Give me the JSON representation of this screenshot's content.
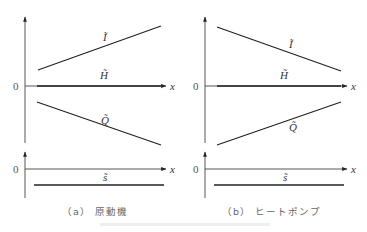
{
  "figure": {
    "panels": [
      {
        "id": "a",
        "caption_label": "（a）",
        "caption_text": "原動機",
        "axis_label_x": "x",
        "zero_label": "0",
        "upper_plot": {
          "lines": [
            {
              "name": "I",
              "label": "Ĩ",
              "trend": "increasing"
            },
            {
              "name": "H",
              "label": "H̃",
              "trend": "constant (on axis)"
            },
            {
              "name": "Q",
              "label": "Q̃",
              "trend": "decreasing"
            }
          ]
        },
        "lower_plot": {
          "lines": [
            {
              "name": "s",
              "label": "s̃",
              "trend": "constant negative"
            }
          ]
        }
      },
      {
        "id": "b",
        "caption_label": "（b）",
        "caption_text": "ヒートポンプ",
        "axis_label_x": "x",
        "zero_label": "0",
        "upper_plot": {
          "lines": [
            {
              "name": "I",
              "label": "Ĩ",
              "trend": "decreasing"
            },
            {
              "name": "H",
              "label": "H̃",
              "trend": "constant (on axis)"
            },
            {
              "name": "Q",
              "label": "Q̃",
              "trend": "increasing"
            }
          ]
        },
        "lower_plot": {
          "lines": [
            {
              "name": "s",
              "label": "s̃",
              "trend": "constant negative"
            }
          ]
        }
      }
    ]
  }
}
